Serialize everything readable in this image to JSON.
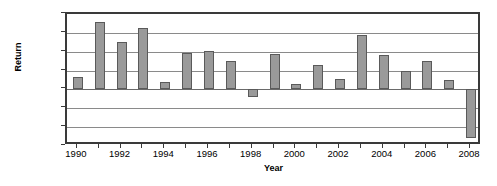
{
  "chart_data": {
    "type": "bar",
    "title": "",
    "xlabel": "Year",
    "ylabel": "Return",
    "categories": [
      1990,
      1991,
      1992,
      1993,
      1994,
      1995,
      1996,
      1997,
      1998,
      1999,
      2000,
      2001,
      2002,
      2003,
      2004,
      2005,
      2006,
      2007,
      2008
    ],
    "values": [
      6.5,
      36.0,
      25.0,
      32.5,
      4.0,
      19.5,
      20.5,
      15.0,
      -4.0,
      19.0,
      3.0,
      13.0,
      5.5,
      29.0,
      18.5,
      10.0,
      15.0,
      5.0,
      -26.0
    ],
    "ylim": [
      -30,
      40
    ],
    "xlim": [
      1989.5,
      2008.5
    ],
    "ytick_values": [
      40,
      30,
      20,
      10,
      0,
      -10,
      -20,
      -30
    ],
    "ytick_labels": [
      "40%",
      "30%",
      "20%",
      "10%",
      "0%",
      "–10%",
      "–20%",
      "–30%"
    ],
    "xtick_values": [
      1990,
      1992,
      1994,
      1996,
      1998,
      2000,
      2002,
      2004,
      2006,
      2008
    ],
    "xtick_labels": [
      "1990",
      "1992",
      "1994",
      "1996",
      "1998",
      "2000",
      "2002",
      "2004",
      "2006",
      "2008"
    ],
    "grid": true,
    "grid_axis": "y",
    "legend": false,
    "legend_position": "none",
    "series": [
      {
        "name": "Return",
        "values": [
          6.5,
          36.0,
          25.0,
          32.5,
          4.0,
          19.5,
          20.5,
          15.0,
          -4.0,
          19.0,
          3.0,
          13.0,
          5.5,
          29.0,
          18.5,
          10.0,
          15.0,
          5.0,
          -26.0
        ]
      }
    ],
    "colors": {
      "bar_fill": "#9a9a9a",
      "bar_border": "#5a5a5a",
      "gridline": "#8a8a8a",
      "frame": "#3a3a3a",
      "background": "#ffffff",
      "text": "#000000"
    }
  }
}
